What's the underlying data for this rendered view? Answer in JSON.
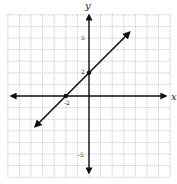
{
  "chart_data": {
    "type": "line",
    "title": "",
    "xlabel": "x",
    "ylabel": "y",
    "xlim": [
      -7,
      7
    ],
    "ylim": [
      -7,
      7
    ],
    "grid": true,
    "grid_step": 1,
    "legend": null,
    "series": [
      {
        "name": "y = x + 2",
        "slope": 1,
        "intercept": 2,
        "x": [
          -4.65,
          3.5
        ],
        "y": [
          -2.65,
          5.5
        ],
        "arrows_both_ends": true
      }
    ],
    "points": [
      {
        "x": -2,
        "y": 0,
        "label": "-2"
      },
      {
        "x": 0,
        "y": 2,
        "label": "2"
      }
    ],
    "tick_labels": {
      "x": [
        {
          "value": -2,
          "text": "-2"
        }
      ],
      "y": [
        {
          "value": 5,
          "text": "5"
        },
        {
          "value": 2,
          "text": "2"
        },
        {
          "value": -5,
          "text": "-5"
        }
      ]
    }
  },
  "labels": {
    "x_axis": "x",
    "y_axis": "y",
    "tick_y_5": "5",
    "tick_y_2": "2",
    "tick_y_neg5": "-5",
    "tick_x_neg2": "-2"
  },
  "colors": {
    "grid": "#9a9a9a",
    "axis": "#111111",
    "line": "#111111",
    "background": "#ffffff"
  }
}
